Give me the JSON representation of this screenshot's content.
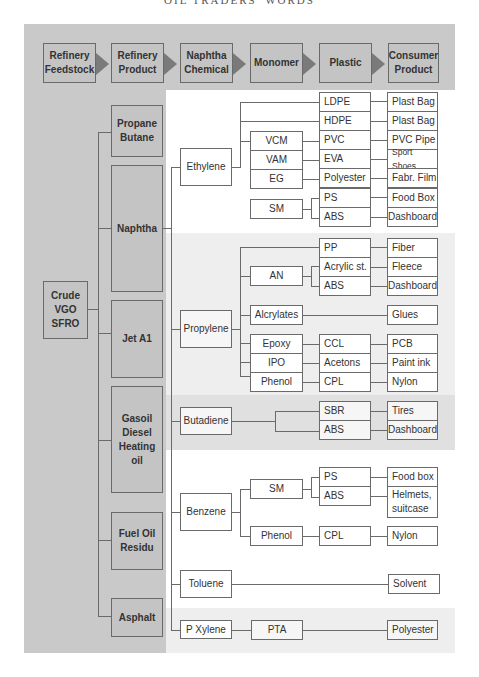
{
  "page_header": "OIL TRADERS' WORDS",
  "stages": [
    "Refinery Feedstock",
    "Refinery Product",
    "Naphtha Chemical",
    "Monomer",
    "Plastic",
    "Consumer Product"
  ],
  "feedstock": "Crude VGO SFRO",
  "refinery_products": [
    "Propane Butane",
    "Naphtha",
    "Jet A1",
    "Gasoil Diesel Heating oil",
    "Fuel Oil Residu",
    "Asphalt"
  ],
  "chemicals": [
    "Ethylene",
    "Propylene",
    "Butadiene",
    "Benzene",
    "Toluene",
    "P Xylene"
  ],
  "ethylene": {
    "monomers": [
      "VCM",
      "VAM",
      "EG",
      "SM"
    ],
    "plastics": [
      "LDPE",
      "HDPE",
      "PVC",
      "EVA",
      "Polyester",
      "PS",
      "ABS"
    ],
    "products": [
      "Plast Bag",
      "Plast Bag",
      "PVC Pipe",
      "Sport Shoes",
      "Fabr. Film",
      "Food Box",
      "Dashboard"
    ]
  },
  "propylene": {
    "monomers": [
      "AN",
      "Alcrylates",
      "Epoxy",
      "IPO",
      "Phenol"
    ],
    "plastics": [
      "PP",
      "Acrylic st.",
      "ABS",
      "CCL",
      "Acetons",
      "CPL"
    ],
    "products": [
      "Fiber",
      "Fleece",
      "Dashboard",
      "Glues",
      "PCB",
      "Paint ink",
      "Nylon"
    ]
  },
  "butadiene": {
    "plastics": [
      "SBR",
      "ABS"
    ],
    "products": [
      "Tires",
      "Dashboard"
    ]
  },
  "benzene": {
    "monomers": [
      "SM",
      "Phenol"
    ],
    "plastics": [
      "PS",
      "ABS",
      "CPL"
    ],
    "products": [
      "Food box",
      "Helmets, suitcase",
      "Nylon"
    ]
  },
  "toluene": {
    "products": [
      "Solvent"
    ]
  },
  "pxylene": {
    "monomers": [
      "PTA"
    ],
    "products": [
      "Polyester"
    ]
  }
}
